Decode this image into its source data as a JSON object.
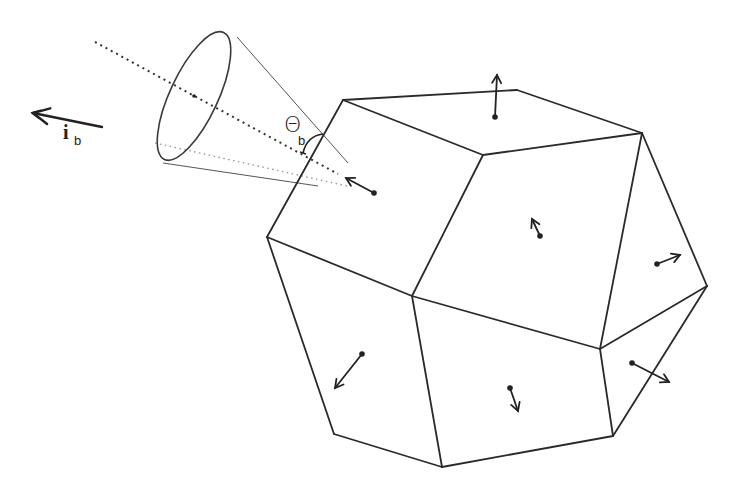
{
  "figure": {
    "width": 732,
    "height": 494,
    "background": "#ffffff",
    "ink_color": "#222222"
  },
  "labels": {
    "theta": {
      "text": "Θ",
      "sub": "b",
      "x": 284,
      "y": 114,
      "sub_x": 298,
      "sub_y": 134
    },
    "beam_direction": {
      "text": "i",
      "sub": "b",
      "x": 63,
      "y": 122,
      "sub_x": 74,
      "sub_y": 134
    }
  },
  "beam_arrow": {
    "name": "i_b",
    "tail": [
      102,
      127
    ],
    "tip": [
      33,
      113
    ]
  },
  "cone": {
    "ellipse": {
      "cx": 194,
      "cy": 96,
      "rx": 24,
      "ry": 70,
      "rotate": 25
    },
    "upper_line": {
      "from": [
        237,
        37
      ],
      "to": [
        348,
        163
      ]
    },
    "lower_line": {
      "from": [
        163,
        163
      ],
      "to": [
        318,
        186
      ]
    },
    "axis_line": {
      "from": [
        95,
        42
      ],
      "to": [
        338,
        174
      ]
    },
    "lower_dotted_line": {
      "from": [
        155,
        143
      ],
      "to": [
        347,
        186
      ]
    },
    "angle_arc": {
      "from": [
        303,
        153
      ],
      "to": [
        323,
        134
      ],
      "label": "Θb"
    }
  },
  "polyhedron": {
    "vertices": {
      "A": [
        343,
        100
      ],
      "B": [
        517,
        90
      ],
      "C": [
        642,
        133
      ],
      "D": [
        483,
        155
      ],
      "E": [
        267,
        237
      ],
      "F": [
        412,
        296
      ],
      "G": [
        707,
        286
      ],
      "H": [
        600,
        349
      ],
      "I": [
        334,
        434
      ],
      "J": [
        442,
        467
      ],
      "K": [
        613,
        436
      ]
    },
    "edges": [
      [
        "A",
        "B"
      ],
      [
        "B",
        "C"
      ],
      [
        "A",
        "D"
      ],
      [
        "D",
        "C"
      ],
      [
        "A",
        "E"
      ],
      [
        "E",
        "F"
      ],
      [
        "D",
        "F"
      ],
      [
        "C",
        "G"
      ],
      [
        "C",
        "H"
      ],
      [
        "F",
        "H"
      ],
      [
        "H",
        "G"
      ],
      [
        "E",
        "I"
      ],
      [
        "I",
        "J"
      ],
      [
        "F",
        "J"
      ],
      [
        "J",
        "K"
      ],
      [
        "H",
        "K"
      ],
      [
        "G",
        "K"
      ]
    ],
    "face_normals": [
      {
        "face": "top",
        "dot": [
          495,
          117
        ],
        "tip": [
          497,
          75
        ]
      },
      {
        "face": "upper-left",
        "dot": [
          374,
          193
        ],
        "tip": [
          346,
          178
        ]
      },
      {
        "face": "center",
        "dot": [
          540,
          236
        ],
        "tip": [
          532,
          219
        ]
      },
      {
        "face": "upper-right",
        "dot": [
          657,
          264
        ],
        "tip": [
          680,
          255
        ]
      },
      {
        "face": "lower-right",
        "dot": [
          632,
          363
        ],
        "tip": [
          669,
          382
        ]
      },
      {
        "face": "lower-left",
        "dot": [
          362,
          354
        ],
        "tip": [
          335,
          388
        ]
      },
      {
        "face": "bottom",
        "dot": [
          510,
          388
        ],
        "tip": [
          518,
          411
        ]
      }
    ]
  }
}
